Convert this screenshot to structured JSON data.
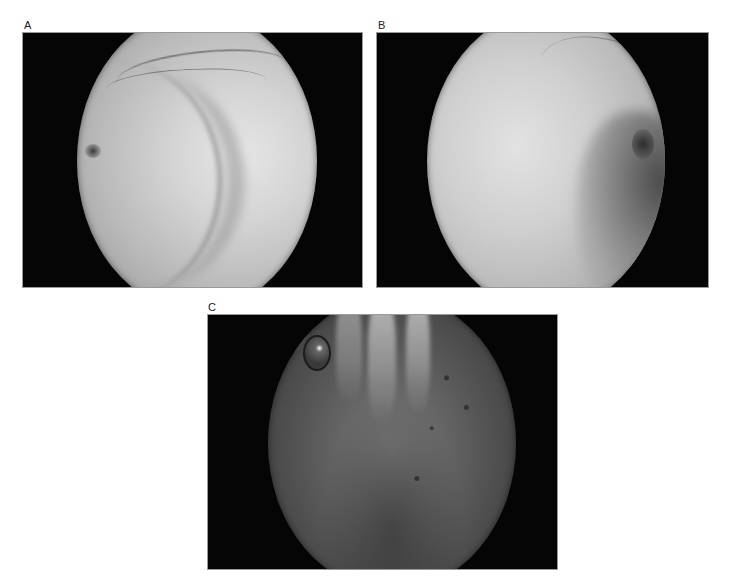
{
  "figure": {
    "panels": [
      {
        "id": "A",
        "label": "A",
        "description": "Endoscopic view: pale uterine cavity with concentric fold and left ostium"
      },
      {
        "id": "B",
        "label": "B",
        "description": "Endoscopic view: pale cavity with darker right-side recess and ostium"
      },
      {
        "id": "C",
        "label": "C",
        "description": "Endoscopic view: darker cavity with hanging tissue strands and air bubble"
      }
    ]
  }
}
